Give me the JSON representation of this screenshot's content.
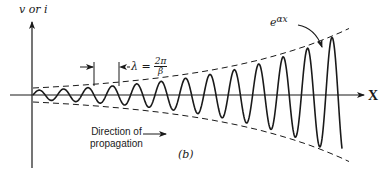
{
  "figure": {
    "y_axis_label": "v or i",
    "x_axis_label": "X",
    "envelope_label_base": "e",
    "envelope_label_exp": "αx",
    "wavelength_label": "λ =",
    "wavelength_numerator": "2π",
    "wavelength_denominator": "β",
    "direction_label_line1": "Direction of",
    "direction_label_line2": "propagation",
    "panel_label": "(b)"
  },
  "chart_data": {
    "type": "line",
    "title": "",
    "xlabel": "X",
    "ylabel": "v or i",
    "wave": {
      "start_x": 33,
      "end_x": 342,
      "axis_y": 95,
      "period_px": 24.4,
      "amp_start": 5,
      "amp_end": 59,
      "peaks_x": [
        42,
        65,
        87,
        110,
        134,
        160,
        187,
        210,
        237,
        262,
        286,
        310,
        335
      ],
      "peaks_y": [
        90,
        89,
        88,
        87,
        86,
        84,
        82,
        78,
        73,
        67,
        60,
        50,
        37
      ]
    },
    "envelope": {
      "start_x": 33,
      "end_x": 350,
      "amp_start": 7,
      "amp_end": 67,
      "style": "dashed"
    },
    "wavelength_marker": {
      "left_x": 94,
      "right_x": 119,
      "arrow_y": 67
    },
    "colors": {
      "ink": "#1a1a1a",
      "background": "#ffffff"
    }
  }
}
